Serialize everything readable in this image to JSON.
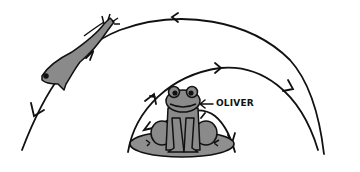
{
  "diagram": {
    "label": "OLIVER",
    "label_arrow": "←",
    "colors": {
      "ink": "#111111",
      "frog_fill": "#8a8a8a",
      "pad_fill": "#8f8f8f",
      "background": "#ffffff"
    },
    "elements": [
      {
        "name": "leaping-frog",
        "description": "Frog mid-jump along outer arc"
      },
      {
        "name": "sitting-frog",
        "description": "Frog named Oliver sitting on lily pad"
      },
      {
        "name": "lily-pad",
        "description": "Lily pad under Oliver"
      },
      {
        "name": "outer-arc",
        "description": "Large arc with arrows pointing right-to-left"
      },
      {
        "name": "middle-arc",
        "description": "Arc with arrows pointing left-to-right"
      },
      {
        "name": "inner-arc",
        "description": "Small arc around Oliver with arrows"
      }
    ]
  }
}
